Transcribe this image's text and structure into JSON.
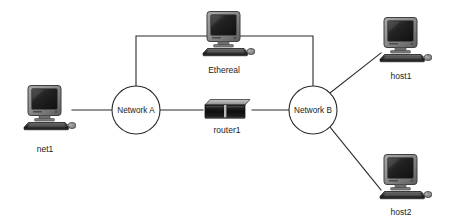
{
  "diagram": {
    "background_color": "#ffffff",
    "line_color": "#2b2b2b",
    "label_color": "#1a1a1a",
    "nodes": [
      {
        "id": "net1",
        "label": "net1",
        "type": "computer",
        "icon": "desktop-computer-icon",
        "x": 48,
        "y": 108,
        "label_x": 48,
        "label_y": 150
      },
      {
        "id": "ethereal",
        "label": "Ethereal",
        "type": "computer",
        "icon": "desktop-computer-icon",
        "x": 227,
        "y": 34,
        "label_x": 227,
        "label_y": 71
      },
      {
        "id": "host1",
        "label": "host1",
        "type": "computer",
        "icon": "desktop-computer-icon",
        "x": 404,
        "y": 40,
        "label_x": 404,
        "label_y": 77
      },
      {
        "id": "host2",
        "label": "host2",
        "type": "computer",
        "icon": "desktop-computer-icon",
        "x": 404,
        "y": 177,
        "label_x": 404,
        "label_y": 213
      },
      {
        "id": "router1",
        "label": "router1",
        "type": "router",
        "icon": "router-box-icon",
        "x": 227,
        "y": 110,
        "label_x": 227,
        "label_y": 131
      },
      {
        "id": "network_a",
        "label": "Network A",
        "type": "cloud",
        "icon": "network-circle-icon",
        "x": 136,
        "y": 110,
        "radius": 24
      },
      {
        "id": "network_b",
        "label": "Network B",
        "type": "cloud",
        "icon": "network-circle-icon",
        "x": 313,
        "y": 110,
        "radius": 24
      }
    ],
    "links": [
      {
        "id": "net1-networka",
        "from": "net1",
        "to": "network_a",
        "path": "M 72 110 L 112 110"
      },
      {
        "id": "networka-router1",
        "from": "network_a",
        "to": "router1",
        "path": "M 160 110 L 203 110"
      },
      {
        "id": "router1-networkb",
        "from": "router1",
        "to": "network_b",
        "path": "M 252 110 L 289 110"
      },
      {
        "id": "networka-ethereal",
        "from": "network_a",
        "to": "ethereal",
        "path": "M 136 86 L 136 36 L 227 36"
      },
      {
        "id": "ethereal-networkb",
        "from": "ethereal",
        "to": "network_b",
        "path": "M 227 36 L 313 36 L 313 86"
      },
      {
        "id": "networkb-host1",
        "from": "network_b",
        "to": "host1",
        "path": "M 330 93 L 381 53"
      },
      {
        "id": "networkb-host2",
        "from": "network_b",
        "to": "host2",
        "path": "M 330 127 L 381 190"
      }
    ]
  }
}
